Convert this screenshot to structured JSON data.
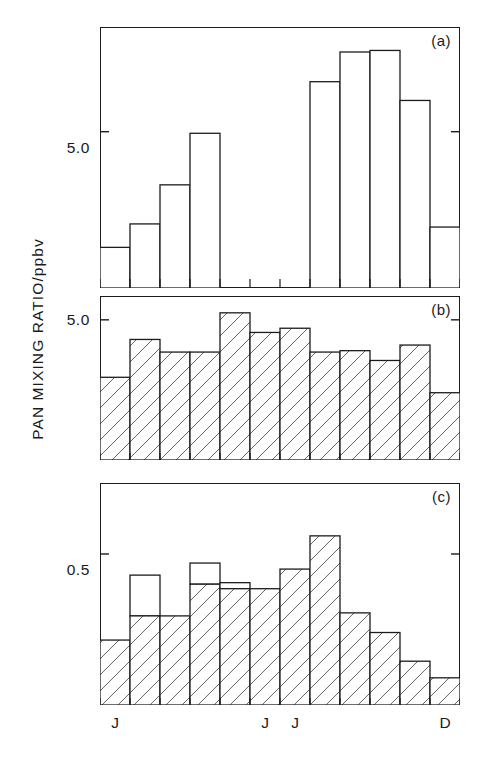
{
  "axis": {
    "ylabel": "PAN MIXING RATIO/ppbv",
    "xtick_labels": [
      "J",
      "J",
      "J",
      "D"
    ],
    "xtick_months": [
      1,
      6,
      7,
      12
    ]
  },
  "panels": [
    {
      "tag": "(a)",
      "ytick_label": "5.0",
      "ytick_value": 5.0
    },
    {
      "tag": "(b)",
      "ytick_label": "5.0",
      "ytick_value": 5.0
    },
    {
      "tag": "(c)",
      "ytick_label": "0.5",
      "ytick_value": 0.5
    }
  ],
  "chart_data": [
    {
      "type": "bar",
      "title": "(a)",
      "xlabel": "",
      "ylabel": "PAN MIXING RATIO/ppbv",
      "categories": [
        "J",
        "F",
        "M",
        "A",
        "M",
        "J",
        "J",
        "A",
        "S",
        "O",
        "N",
        "D"
      ],
      "tick_labels": [
        "J",
        "",
        "",
        "",
        "",
        "J",
        "J",
        "",
        "",
        "",
        "",
        "D"
      ],
      "values": [
        1.3,
        2.05,
        3.3,
        4.95,
        null,
        null,
        null,
        6.6,
        7.55,
        7.6,
        6.0,
        1.95
      ],
      "ylim": [
        0,
        8.35
      ],
      "yticks": [
        5.0
      ],
      "grid": false,
      "legend": null,
      "bar_style": "open"
    },
    {
      "type": "bar",
      "title": "(b)",
      "xlabel": "",
      "ylabel": "PAN MIXING RATIO/ppbv",
      "categories": [
        "J",
        "F",
        "M",
        "A",
        "M",
        "J",
        "J",
        "A",
        "S",
        "O",
        "N",
        "D"
      ],
      "tick_labels": [
        "J",
        "",
        "",
        "",
        "",
        "J",
        "J",
        "",
        "",
        "",
        "",
        "D"
      ],
      "values": [
        2.95,
        4.3,
        3.85,
        3.85,
        5.25,
        4.55,
        4.7,
        3.85,
        3.9,
        3.55,
        4.1,
        2.4
      ],
      "ylim": [
        0,
        5.85
      ],
      "yticks": [
        5.0
      ],
      "grid": false,
      "legend": null,
      "bar_style": "hatched"
    },
    {
      "type": "bar",
      "title": "(c)",
      "xlabel": "",
      "ylabel": "PAN MIXING RATIO/ppbv",
      "categories": [
        "J",
        "F",
        "M",
        "A",
        "M",
        "J",
        "J",
        "A",
        "S",
        "O",
        "N",
        "D"
      ],
      "tick_labels": [
        "J",
        "",
        "",
        "",
        "",
        "J",
        "J",
        "",
        "",
        "",
        "",
        "D"
      ],
      "series": [
        {
          "name": "measured",
          "values": [
            0.215,
            0.295,
            0.295,
            0.36,
            0.4,
            0.385,
            0.385,
            0.45,
            0.56,
            0.305,
            0.24,
            0.145,
            0.09
          ],
          "style": "hatched"
        },
        {
          "name": "upper range",
          "values": [
            null,
            0.43,
            null,
            0.47,
            0.405,
            null,
            null,
            null,
            null,
            null,
            null,
            null
          ],
          "style": "open"
        }
      ],
      "values": [
        0.215,
        0.295,
        0.295,
        0.4,
        0.385,
        0.385,
        0.45,
        0.56,
        0.305,
        0.24,
        0.145,
        0.09
      ],
      "upper_values": [
        null,
        0.43,
        null,
        0.47,
        0.405,
        null,
        null,
        null,
        null,
        null,
        null,
        null
      ],
      "ylim": [
        0,
        0.735
      ],
      "yticks": [
        0.5
      ],
      "grid": false,
      "legend": null,
      "bar_style": "hatched-with-open-overlay"
    }
  ],
  "colors": {
    "axis": "#1c1c1c",
    "bar_stroke": "#1c1c1c",
    "bar_fill": "#ffffff",
    "hatch": "#555555",
    "background": "#ffffff"
  }
}
